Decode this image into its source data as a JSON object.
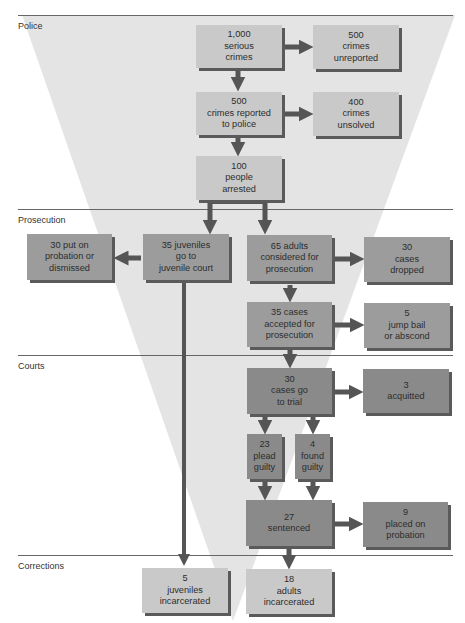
{
  "sections": [
    {
      "label": "Police",
      "line_y": 15,
      "label_y": 21
    },
    {
      "label": "Prosecution",
      "line_y": 209,
      "label_y": 215
    },
    {
      "label": "Courts",
      "line_y": 355,
      "label_y": 361
    },
    {
      "label": "Corrections",
      "line_y": 555,
      "label_y": 561
    }
  ],
  "colors": {
    "funnel": "#e4e4e4",
    "box_light": "#c9c9c9",
    "box_mid": "#9c9c9c",
    "box_dark": "#8a8a8a",
    "arrow": "#555555",
    "line": "#666666"
  },
  "boxes": {
    "serious_crimes": {
      "lines": [
        "1,000",
        "serious",
        "crimes"
      ]
    },
    "crimes_unreported": {
      "lines": [
        "500",
        "crimes",
        "unreported"
      ]
    },
    "crimes_reported": {
      "lines": [
        "500",
        "crimes reported",
        "to police"
      ]
    },
    "crimes_unsolved": {
      "lines": [
        "400",
        "crimes",
        "unsolved"
      ]
    },
    "people_arrested": {
      "lines": [
        "100",
        "people",
        "arrested"
      ]
    },
    "probation_dismissed": {
      "lines": [
        "30 put on",
        "probation or",
        "dismissed"
      ]
    },
    "juvenile_court": {
      "lines": [
        "35 juveniles",
        "go to",
        "juvenile court"
      ]
    },
    "adults_considered": {
      "lines": [
        "65 adults",
        "considered for",
        "prosecution"
      ]
    },
    "cases_dropped": {
      "lines": [
        "30",
        "cases",
        "dropped"
      ]
    },
    "cases_accepted": {
      "lines": [
        "35 cases",
        "accepted for",
        "prosecution"
      ]
    },
    "jump_bail": {
      "lines": [
        "5",
        "jump bail",
        "or abscond"
      ]
    },
    "go_to_trial": {
      "lines": [
        "30",
        "cases go",
        "to trial"
      ]
    },
    "acquitted": {
      "lines": [
        "3",
        "acquitted"
      ]
    },
    "plead_guilty": {
      "lines": [
        "23",
        "plead",
        "guilty"
      ]
    },
    "found_guilty": {
      "lines": [
        "4",
        "found",
        "guilty"
      ]
    },
    "sentenced": {
      "lines": [
        "27",
        "sentenced"
      ]
    },
    "placed_probation": {
      "lines": [
        "9",
        "placed on",
        "probation"
      ]
    },
    "juveniles_incarcerated": {
      "lines": [
        "5",
        "juveniles",
        "incarcerated"
      ]
    },
    "adults_incarcerated": {
      "lines": [
        "18",
        "adults",
        "incarcerated"
      ]
    }
  }
}
